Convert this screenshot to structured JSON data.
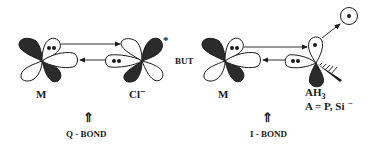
{
  "left_panel": {
    "metal_label": "M",
    "ligand_label": "Cl",
    "ligand_charge": "−",
    "ligand_star": "*",
    "bond_arrow": "⇑",
    "bond_label": "Q - BOND"
  },
  "connector": "BUT",
  "right_panel": {
    "metal_label": "M",
    "ligand_label": "AH",
    "ligand_subscript": "3",
    "ligand_definition": "A = P, Si",
    "ligand_def_charge": "−",
    "bond_arrow": "⇑",
    "bond_label": "I - BOND"
  },
  "colors": {
    "lobe_dark": "#2b2b2b",
    "lobe_light": "#ffffff",
    "ink": "#1a1a1a"
  }
}
